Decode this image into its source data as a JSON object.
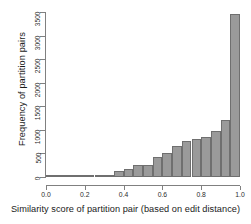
{
  "chart_data": {
    "type": "bar",
    "title": "",
    "subtitle": "",
    "xlabel": "Similarity score of partition pair (based on edit distance)",
    "ylabel": "Frequency of partition pairs",
    "grid": false,
    "legend": null,
    "xlim": [
      0.0,
      1.0
    ],
    "ylim": [
      0,
      3500
    ],
    "xticks": [
      0.0,
      0.2,
      0.4,
      0.6,
      0.8,
      1.0
    ],
    "xtick_labels": [
      "0.0",
      "0.2",
      "0.4",
      "0.6",
      "0.8",
      "1.0"
    ],
    "yticks": [
      0,
      500,
      1000,
      1500,
      2000,
      2500,
      3000,
      3500
    ],
    "ytick_labels": [
      "0",
      "500",
      "1000",
      "1500",
      "2000",
      "2500",
      "3000",
      "3500"
    ],
    "bin_width": 0.05,
    "bin_edges": [
      0.0,
      0.05,
      0.1,
      0.15,
      0.2,
      0.25,
      0.3,
      0.35,
      0.4,
      0.45,
      0.5,
      0.55,
      0.6,
      0.65,
      0.7,
      0.75,
      0.8,
      0.85,
      0.9,
      0.95,
      1.0
    ],
    "categories": [
      "0.00-0.05",
      "0.05-0.10",
      "0.10-0.15",
      "0.15-0.20",
      "0.20-0.25",
      "0.25-0.30",
      "0.30-0.35",
      "0.35-0.40",
      "0.40-0.45",
      "0.45-0.50",
      "0.50-0.55",
      "0.55-0.60",
      "0.60-0.65",
      "0.65-0.70",
      "0.70-0.75",
      "0.75-0.80",
      "0.80-0.85",
      "0.85-0.90",
      "0.90-0.95",
      "0.95-1.00"
    ],
    "values": [
      5,
      5,
      8,
      10,
      15,
      20,
      30,
      130,
      180,
      265,
      250,
      430,
      500,
      650,
      770,
      800,
      850,
      980,
      1220,
      3460
    ],
    "bar_color": "#9a9a9a",
    "bar_border_color": "#6f6f6f",
    "axis_color": "#808080",
    "text_color": "#1a1a1a"
  }
}
